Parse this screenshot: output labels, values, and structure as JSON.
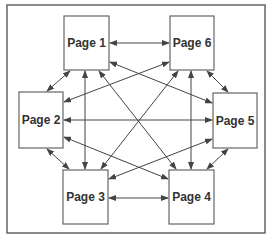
{
  "diagram": {
    "type": "fully-connected page link diagram",
    "frame": {
      "x": 7,
      "y": 5,
      "width": 258,
      "height": 228,
      "stroke": "#666666"
    },
    "colors": {
      "box_stroke": "#666666",
      "arrow": "#444444",
      "text": "#333333",
      "background": "#ffffff"
    },
    "nodes": [
      {
        "id": "page1",
        "label": "Page 1",
        "x": 64,
        "y": 16,
        "w": 45,
        "h": 54
      },
      {
        "id": "page6",
        "label": "Page 6",
        "x": 170,
        "y": 16,
        "w": 44,
        "h": 54
      },
      {
        "id": "page2",
        "label": "Page 2",
        "x": 19,
        "y": 92,
        "w": 44,
        "h": 56
      },
      {
        "id": "page5",
        "label": "Page 5",
        "x": 213,
        "y": 93,
        "w": 44,
        "h": 55
      },
      {
        "id": "page3",
        "label": "Page 3",
        "x": 63,
        "y": 170,
        "w": 45,
        "h": 54
      },
      {
        "id": "page4",
        "label": "Page 4",
        "x": 169,
        "y": 170,
        "w": 45,
        "h": 54
      }
    ],
    "edges": [
      {
        "from": "page1",
        "to": "page6",
        "bidirectional": true,
        "x1": 110,
        "y1": 43,
        "x2": 169,
        "y2": 43
      },
      {
        "from": "page3",
        "to": "page4",
        "bidirectional": true,
        "x1": 109,
        "y1": 198,
        "x2": 168,
        "y2": 198
      },
      {
        "from": "page2",
        "to": "page5",
        "bidirectional": true,
        "x1": 64,
        "y1": 120,
        "x2": 212,
        "y2": 120
      },
      {
        "from": "page1",
        "to": "page2",
        "bidirectional": true,
        "x1": 70,
        "y1": 71,
        "x2": 47,
        "y2": 91
      },
      {
        "from": "page6",
        "to": "page5",
        "bidirectional": true,
        "x1": 207,
        "y1": 71,
        "x2": 228,
        "y2": 92
      },
      {
        "from": "page2",
        "to": "page3",
        "bidirectional": true,
        "x1": 47,
        "y1": 149,
        "x2": 69,
        "y2": 169
      },
      {
        "from": "page5",
        "to": "page4",
        "bidirectional": true,
        "x1": 228,
        "y1": 149,
        "x2": 207,
        "y2": 169
      },
      {
        "from": "page1",
        "to": "page3",
        "bidirectional": true,
        "x1": 85,
        "y1": 71,
        "x2": 85,
        "y2": 169
      },
      {
        "from": "page6",
        "to": "page4",
        "bidirectional": true,
        "x1": 191,
        "y1": 71,
        "x2": 191,
        "y2": 169
      },
      {
        "from": "page1",
        "to": "page5",
        "bidirectional": true,
        "x1": 110,
        "y1": 62,
        "x2": 212,
        "y2": 103
      },
      {
        "from": "page6",
        "to": "page2",
        "bidirectional": true,
        "x1": 169,
        "y1": 62,
        "x2": 64,
        "y2": 102
      },
      {
        "from": "page2",
        "to": "page4",
        "bidirectional": true,
        "x1": 64,
        "y1": 137,
        "x2": 168,
        "y2": 179
      },
      {
        "from": "page5",
        "to": "page3",
        "bidirectional": true,
        "x1": 212,
        "y1": 139,
        "x2": 109,
        "y2": 179
      },
      {
        "from": "page1",
        "to": "page4",
        "bidirectional": true,
        "x1": 99,
        "y1": 71,
        "x2": 176,
        "y2": 169
      },
      {
        "from": "page6",
        "to": "page3",
        "bidirectional": true,
        "x1": 178,
        "y1": 71,
        "x2": 101,
        "y2": 169
      }
    ]
  }
}
